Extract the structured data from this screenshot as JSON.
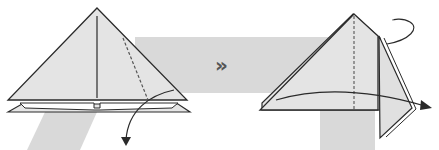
{
  "diagram": {
    "type": "origami-folding-instructions",
    "steps": [
      {
        "id": "step-1",
        "description": "Layered triangle with center crease and a dashed valley-fold line on the right; curved arrow indicates folding the right flap down",
        "elements": [
          "triangle",
          "center-crease",
          "valley-fold-dashed-line",
          "bottom-layers",
          "fold-arrow"
        ]
      },
      {
        "id": "step-2",
        "description": "Right flap folded down; dashed center line; curved arrow indicates turning/pulling the flap to the right; looping arrow at top right",
        "elements": [
          "folded-triangle",
          "dashed-center-line",
          "curved-arrow-right",
          "loop-arrow"
        ]
      }
    ],
    "next_step_symbol": "»",
    "colors": {
      "background": "#ffffff",
      "band": "#d8d8d8",
      "paper": "#e4e4e4",
      "line": "#2a2a2a",
      "symbol": "#555555"
    }
  }
}
